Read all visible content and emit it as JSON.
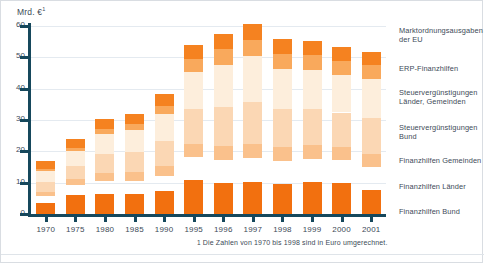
{
  "axis": {
    "unit_label": "Mrd. €",
    "unit_footnote_marker": "1",
    "y_ticks": [
      "60",
      "50",
      "40",
      "30",
      "20",
      "10",
      "0"
    ]
  },
  "footnote": {
    "marker": "1",
    "text": "Die Zahlen von 1970 bis 1998 sind in Euro umgerechnet."
  },
  "legend": {
    "items": [
      {
        "label": "Marktordnungsausgaben der EU",
        "color": "#f58220"
      },
      {
        "label": "ERP-Finanzhilfen",
        "color": "#f9a95c"
      },
      {
        "label": "Steuervergünstigungen Länder, Gemeinden",
        "color": "#fdeedc"
      },
      {
        "label": "Steuervergünstigungen Bund",
        "color": "#fbd7b4"
      },
      {
        "label": "Finanzhilfen Gemeinden",
        "color": "#fac18c"
      },
      {
        "label": "Finanzhilfen Länder",
        "color": "#f9a council"
      },
      {
        "label": "Finanzhilfen Bund",
        "color": "#f2700f"
      }
    ]
  },
  "chart_data": {
    "type": "bar",
    "title": "Mrd. €",
    "xlabel": "",
    "ylabel": "Mrd. €",
    "ylim": [
      0,
      60
    ],
    "grid": true,
    "stacked": true,
    "legend_position": "right",
    "categories": [
      "1970",
      "1975",
      "1980",
      "1985",
      "1990",
      "1995",
      "1996",
      "1997",
      "1998",
      "1999",
      "2000",
      "2001"
    ],
    "series": [
      {
        "name": "Finanzhilfen Bund",
        "color": "#f2700f",
        "values": [
          3.6,
          6.2,
          6.5,
          6.3,
          7.2,
          11.0,
          9.8,
          10.2,
          9.6,
          10.3,
          10.0,
          7.6
        ]
      },
      {
        "name": "Finanzhilfen Länder",
        "color": "#f9a council",
        "values": [
          2.0,
          3.0,
          4.0,
          4.3,
          5.0,
          7.2,
          7.4,
          7.6,
          7.4,
          7.4,
          7.2,
          7.4
        ]
      },
      {
        "name": "Finanzhilfen Gemeinden",
        "color": "#fac18c",
        "values": [
          1.5,
          2.0,
          2.6,
          2.8,
          3.2,
          4.2,
          4.4,
          4.5,
          4.4,
          4.3,
          4.2,
          4.3
        ]
      },
      {
        "name": "Steuervergünstigungen Bund",
        "color": "#fbd7b4",
        "values": [
          3.1,
          4.2,
          6.0,
          6.4,
          8.0,
          11.0,
          12.5,
          13.5,
          12.0,
          11.5,
          11.0,
          11.5
        ]
      },
      {
        "name": "Steuervergünstigungen Länder, Gemeinden",
        "color": "#fdeedc",
        "values": [
          3.4,
          4.6,
          6.4,
          7.0,
          8.6,
          12.0,
          13.5,
          14.5,
          13.0,
          12.5,
          12.0,
          12.4
        ]
      },
      {
        "name": "ERP-Finanzhilfen",
        "color": "#f9a95c",
        "values": [
          0.9,
          1.2,
          1.6,
          1.8,
          2.4,
          4.2,
          5.0,
          5.3,
          4.8,
          4.6,
          4.4,
          4.3
        ]
      },
      {
        "name": "Marktordnungsausgaben der EU",
        "color": "#f58220",
        "values": [
          2.5,
          2.6,
          3.3,
          3.4,
          4.0,
          4.4,
          4.8,
          4.9,
          4.6,
          4.7,
          4.5,
          4.3
        ]
      }
    ],
    "totals": [
      17.0,
      23.8,
      30.4,
      32.0,
      38.4,
      54.0,
      57.4,
      60.5,
      55.8,
      55.3,
      53.3,
      51.8
    ]
  }
}
